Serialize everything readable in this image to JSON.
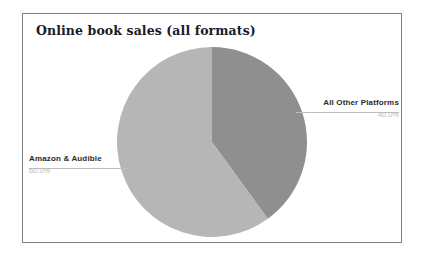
{
  "chart_data": {
    "type": "pie",
    "title": "Online book sales (all formats)",
    "categories": [
      "All Other Platforms",
      "Amazon & Audible"
    ],
    "values": [
      40.0,
      60.0
    ],
    "value_labels": [
      "40.0%",
      "60.0%"
    ],
    "units": "percent",
    "legend": "none",
    "grid": false,
    "start_angle_deg": 90,
    "direction": "clockwise",
    "slices": [
      {
        "label": "All Other Platforms",
        "value": 40.0,
        "pct_label": "40.0%",
        "color": "#8f8f8f",
        "label_side": "right"
      },
      {
        "label": "Amazon & Audible",
        "value": 60.0,
        "pct_label": "60.0%",
        "color": "#b6b6b6",
        "label_side": "left"
      }
    ]
  },
  "title": {
    "text": "Online book sales (all formats)"
  },
  "labels": {
    "right": {
      "name": "All Other Platforms",
      "pct": "40.0%"
    },
    "left": {
      "name": "Amazon & Audible",
      "pct": "60.0%"
    }
  },
  "colors": {
    "slice_dark": "#8f8f8f",
    "slice_light": "#b6b6b6",
    "frame_border": "#808080",
    "title_text": "#1b1b2b",
    "label_text": "#2b2b2b",
    "pct_text": "#b9b9b9",
    "leader_line": "#bdbdbd",
    "background": "#ffffff"
  }
}
